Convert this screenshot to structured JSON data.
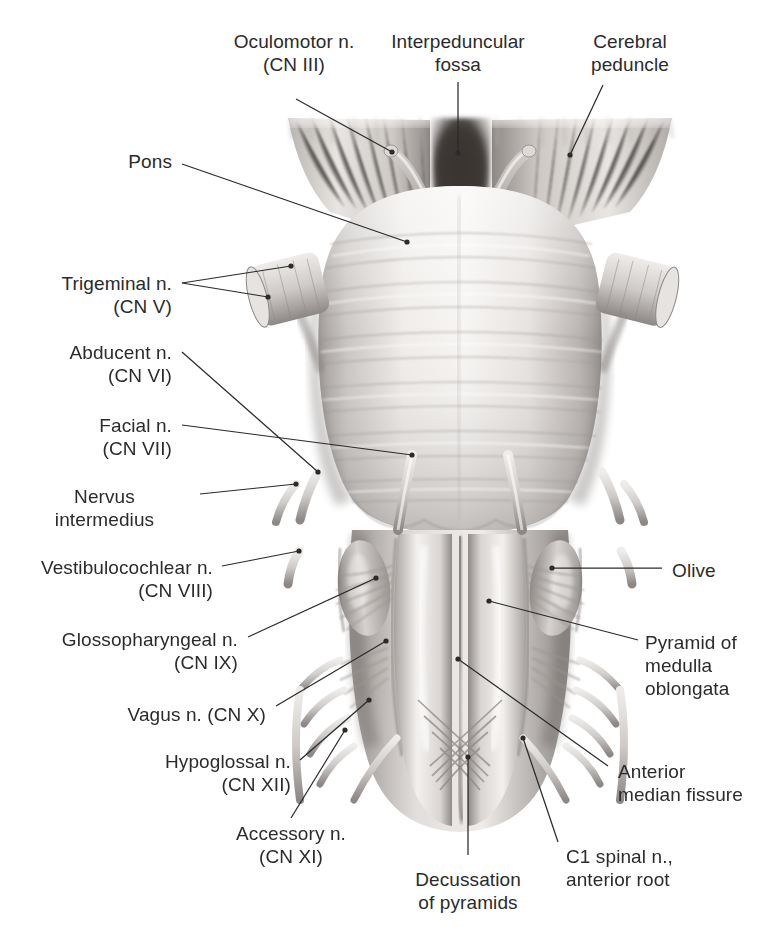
{
  "figure": {
    "style": "grayscale-anatomical-illustration",
    "colors": {
      "background": "#ffffff",
      "text": "#2b2b2b",
      "leader_line": "#2b2b2b",
      "tissue_light": "#f2f0ee",
      "tissue_mid": "#c9c5c2",
      "tissue_dark": "#8d8885",
      "tissue_shadow": "#5f5b58",
      "fossa_dark": "#3f3c3a"
    }
  },
  "labels": [
    {
      "id": "oculomotor",
      "text": "Oculomotor n.\n(CN III)",
      "align": "center",
      "x": 219,
      "y": 30,
      "w": 150
    },
    {
      "id": "interpeduncular",
      "text": "Interpeduncular\nfossa",
      "align": "center",
      "x": 378,
      "y": 30,
      "w": 160
    },
    {
      "id": "cerebral-peduncle",
      "text": "Cerebral\npeduncle",
      "align": "center",
      "x": 560,
      "y": 30,
      "w": 140
    },
    {
      "id": "pons",
      "text": "Pons",
      "align": "right",
      "x": 22,
      "y": 150,
      "w": 150
    },
    {
      "id": "trigeminal",
      "text": "Trigeminal n.\n(CN V)",
      "align": "right",
      "x": 12,
      "y": 272,
      "w": 160
    },
    {
      "id": "abducent",
      "text": "Abducent n.\n(CN VI)",
      "align": "right",
      "x": 12,
      "y": 341,
      "w": 160
    },
    {
      "id": "facial",
      "text": "Facial n.\n(CN VII)",
      "align": "right",
      "x": 12,
      "y": 414,
      "w": 160
    },
    {
      "id": "nervus-intermedius",
      "text": "Nervus\nintermedius",
      "align": "center",
      "x": 22,
      "y": 485,
      "w": 165
    },
    {
      "id": "vestibulocochlear",
      "text": "Vestibulocochlear n.\n(CN VIII)",
      "align": "right",
      "x": 8,
      "y": 556,
      "w": 205
    },
    {
      "id": "glossopharyngeal",
      "text": "Glossopharyngeal n.\n(CN IX)",
      "align": "right",
      "x": 8,
      "y": 628,
      "w": 230
    },
    {
      "id": "vagus",
      "text": "Vagus n. (CN X)",
      "align": "right",
      "x": 8,
      "y": 703,
      "w": 258
    },
    {
      "id": "hypoglossal",
      "text": "Hypoglossal n.\n(CN XII)",
      "align": "right",
      "x": 8,
      "y": 750,
      "w": 283
    },
    {
      "id": "accessory",
      "text": "Accessory n.\n(CN XI)",
      "align": "center",
      "x": 205,
      "y": 822,
      "w": 172
    },
    {
      "id": "olive",
      "text": "Olive",
      "align": "left",
      "x": 672,
      "y": 559,
      "w": 100
    },
    {
      "id": "pyramid",
      "text": "Pyramid of\nmedulla\noblongata",
      "align": "left",
      "x": 645,
      "y": 631,
      "w": 130
    },
    {
      "id": "anterior-fissure",
      "text": "Anterior\nmedian fissure",
      "align": "left",
      "x": 618,
      "y": 760,
      "w": 160
    },
    {
      "id": "decussation",
      "text": "Decussation\nof pyramids",
      "align": "center",
      "x": 392,
      "y": 868,
      "w": 152
    },
    {
      "id": "c1-spinal",
      "text": "C1 spinal n.,\nanterior root",
      "align": "left",
      "x": 566,
      "y": 845,
      "w": 160
    }
  ],
  "leaders": [
    {
      "id": "oculomotor",
      "d": "M 296 99 L 392 152",
      "dot": [
        392,
        152
      ]
    },
    {
      "id": "interpeduncular",
      "d": "M 458 82 L 458 153",
      "dot": [
        458,
        153
      ]
    },
    {
      "id": "cerebral-peduncle",
      "d": "M 603 85 L 570 155",
      "dot": [
        570,
        155
      ]
    },
    {
      "id": "pons",
      "d": "M 182 164 L 407 242",
      "dot": [
        407,
        242
      ]
    },
    {
      "id": "trigeminal-a",
      "d": "M 182 283 L 291 266",
      "dot": [
        291,
        266
      ]
    },
    {
      "id": "trigeminal-b",
      "d": "M 182 283 L 268 297",
      "dot": [
        268,
        297
      ]
    },
    {
      "id": "abducent",
      "d": "M 182 352 L 318 472",
      "dot": [
        318,
        472
      ]
    },
    {
      "id": "facial",
      "d": "M 182 425 L 412 455",
      "dot": [
        412,
        455
      ]
    },
    {
      "id": "nervus-intermedius",
      "d": "M 200 494 L 296 484",
      "dot": [
        296,
        484
      ]
    },
    {
      "id": "vestibulocochlear",
      "d": "M 222 566 L 299 551",
      "dot": [
        299,
        551
      ]
    },
    {
      "id": "glossopharyngeal",
      "d": "M 248 637 L 376 578",
      "dot": [
        376,
        578
      ]
    },
    {
      "id": "vagus",
      "d": "M 276 706 L 386 641",
      "dot": [
        386,
        641
      ]
    },
    {
      "id": "hypoglossal",
      "d": "M 300 760 L 369 700",
      "dot": [
        369,
        700
      ]
    },
    {
      "id": "accessory",
      "d": "M 291 818 L 345 730",
      "dot": [
        345,
        730
      ]
    },
    {
      "id": "olive",
      "d": "M 662 568 L 552 568",
      "dot": [
        552,
        568
      ]
    },
    {
      "id": "pyramid",
      "d": "M 638 640 L 489 601",
      "dot": [
        489,
        601
      ]
    },
    {
      "id": "anterior-fissure",
      "d": "M 608 766 L 458 659",
      "dot": [
        458,
        659
      ]
    },
    {
      "id": "decussation",
      "d": "M 468 855 L 468 757",
      "dot": [
        468,
        757
      ]
    },
    {
      "id": "c1-spinal",
      "d": "M 558 842 L 523 738",
      "dot": [
        523,
        738
      ]
    }
  ]
}
